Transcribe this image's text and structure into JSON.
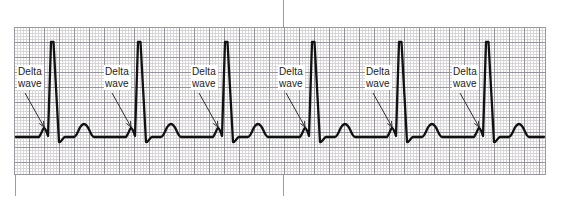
{
  "figure": {
    "kind": "ecg-rhythm-strip",
    "width": 561,
    "height": 208,
    "background_color": "#ffffff"
  },
  "paper": {
    "name": "ecg-graph-paper",
    "x": 14,
    "y": 27,
    "width": 532,
    "height": 148,
    "fine_square_px": 3,
    "bold_square_px": 15,
    "fine_line_color": "#b9b4bb",
    "bold_line_color": "#7c7986",
    "border_color": "#9a97a2"
  },
  "rules": [
    {
      "name": "left-margin-rule",
      "x": 15,
      "y": 175,
      "width": 1,
      "height": 21,
      "color": "#9d9aa6"
    },
    {
      "name": "center-rule-top",
      "x": 283,
      "y": 0,
      "width": 1,
      "height": 27,
      "color": "#9d9aa6"
    },
    {
      "name": "center-rule-bottom",
      "x": 283,
      "y": 175,
      "width": 1,
      "height": 21,
      "color": "#9d9aa6"
    }
  ],
  "trace": {
    "name": "ecg-trace",
    "stroke_color": "#111111",
    "stroke_width": 2.3,
    "baseline_y": 137,
    "r_peak_y": 42,
    "beat_count": 6,
    "beat_interval_px": 87,
    "first_r_peak_x": 52,
    "r_peak_x": [
      52,
      139,
      226,
      313,
      400,
      487
    ],
    "features": [
      "baseline",
      "delta-wave-slur",
      "r-wave-spike",
      "s-wave-dip",
      "t-wave"
    ]
  },
  "annotations": {
    "label_text_line1": "Delta",
    "label_text_line2": "wave",
    "text_color": "#1a1a1a",
    "arrow_color": "#1a1a1a",
    "items": [
      {
        "name": "delta-wave-annotation-1",
        "text_x": 17,
        "text_y": 65,
        "arrow_x1": 25,
        "arrow_y1": 93,
        "arrow_x2": 44,
        "arrow_y2": 127
      },
      {
        "name": "delta-wave-annotation-2",
        "text_x": 104,
        "text_y": 65,
        "arrow_x1": 112,
        "arrow_y1": 93,
        "arrow_x2": 131,
        "arrow_y2": 127
      },
      {
        "name": "delta-wave-annotation-3",
        "text_x": 191,
        "text_y": 65,
        "arrow_x1": 199,
        "arrow_y1": 93,
        "arrow_x2": 218,
        "arrow_y2": 127
      },
      {
        "name": "delta-wave-annotation-4",
        "text_x": 278,
        "text_y": 65,
        "arrow_x1": 286,
        "arrow_y1": 93,
        "arrow_x2": 305,
        "arrow_y2": 127
      },
      {
        "name": "delta-wave-annotation-5",
        "text_x": 365,
        "text_y": 65,
        "arrow_x1": 373,
        "arrow_y1": 93,
        "arrow_x2": 392,
        "arrow_y2": 127
      },
      {
        "name": "delta-wave-annotation-6",
        "text_x": 452,
        "text_y": 65,
        "arrow_x1": 460,
        "arrow_y1": 93,
        "arrow_x2": 479,
        "arrow_y2": 127
      }
    ]
  }
}
